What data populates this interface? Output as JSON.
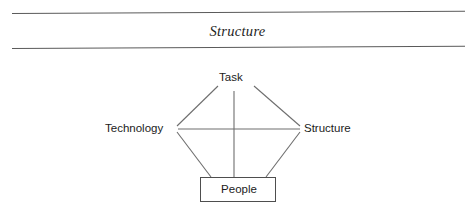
{
  "section": {
    "title": "Structure"
  },
  "diagram": {
    "name": "leavitt-diamond",
    "nodes": {
      "task": "Task",
      "technology": "Technology",
      "structure": "Structure",
      "people": "People"
    }
  },
  "colors": {
    "rule": "#5a5a5a",
    "line": "#6e6e6e",
    "box_border": "#4e4e4e",
    "text": "#1b1b1b",
    "title_text": "#1d1d1d",
    "background": "#ffffff"
  }
}
